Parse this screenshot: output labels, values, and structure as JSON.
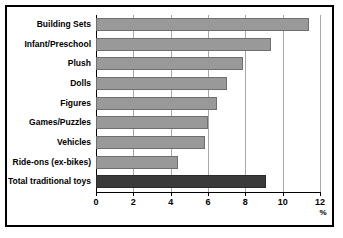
{
  "chart_data": {
    "type": "bar",
    "orientation": "horizontal",
    "title": "",
    "subtitle": "",
    "xlabel": "%",
    "ylabel": "",
    "categories": [
      "Building Sets",
      "Infant/Preschool",
      "Plush",
      "Dolls",
      "Figures",
      "Games/Puzzles",
      "Vehicles",
      "Ride-ons (ex-bikes)",
      "Total traditional toys"
    ],
    "values": [
      11.4,
      9.4,
      7.9,
      7.0,
      6.5,
      6.0,
      5.85,
      4.4,
      9.1
    ],
    "bar_colors": [
      "#999999",
      "#999999",
      "#999999",
      "#999999",
      "#999999",
      "#999999",
      "#999999",
      "#999999",
      "#3a3a3a"
    ],
    "xlim": [
      0,
      12
    ],
    "xticks": [
      0,
      2,
      4,
      6,
      8,
      10,
      12
    ],
    "xtick_labels": [
      "0",
      "2",
      "4",
      "6",
      "8",
      "10",
      "12"
    ],
    "grid": "vertical",
    "legend": "none",
    "axis_unit_label": "%"
  },
  "colors": {
    "bar_gray": "#999999",
    "bar_dark": "#3a3a3a",
    "gridline": "#a8a8a8",
    "frame": "#000000",
    "background": "#ffffff"
  }
}
